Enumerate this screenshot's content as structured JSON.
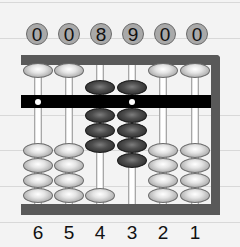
{
  "abacus": {
    "type": "soroban",
    "value_display": [
      "0",
      "0",
      "8",
      "9",
      "0",
      "0"
    ],
    "column_labels": [
      "6",
      "5",
      "4",
      "3",
      "2",
      "1"
    ],
    "columns": [
      {
        "label": "6",
        "value": 0,
        "heaven_active": false,
        "earth_active": 0
      },
      {
        "label": "5",
        "value": 0,
        "heaven_active": false,
        "earth_active": 0
      },
      {
        "label": "4",
        "value": 8,
        "heaven_active": true,
        "earth_active": 3
      },
      {
        "label": "3",
        "value": 9,
        "heaven_active": true,
        "earth_active": 4
      },
      {
        "label": "2",
        "value": 0,
        "heaven_active": false,
        "earth_active": 0
      },
      {
        "label": "1",
        "value": 0,
        "heaven_active": false,
        "earth_active": 0
      }
    ],
    "colors": {
      "frame": "#595959",
      "beam": "#000000",
      "bead_inactive": "#d8d8d8",
      "bead_active": "#3a3a3a",
      "value_circle": "#a9a9a9"
    }
  }
}
